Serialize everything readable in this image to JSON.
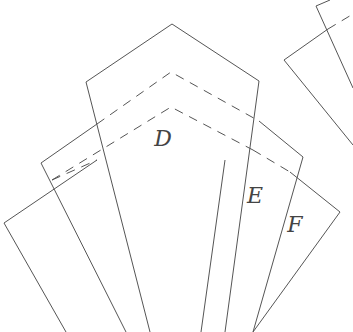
{
  "diagram": {
    "type": "fanned pattern pieces",
    "stroke_color": "#555555",
    "background": "#ffffff",
    "pieces": [
      {
        "id": "A",
        "label": "",
        "points": "4,223 41,196 100,332 66,332",
        "dashed": []
      },
      {
        "id": "B",
        "label": "",
        "points": "41,163 86,131 150,332 126,332",
        "dashed": [
          "41,184 97,124"
        ]
      },
      {
        "id": "C",
        "label": "",
        "points": "86,82 172,24 259,81 225,332 150,332",
        "dashed": [
          "86,131 171,72 259,121",
          "97,160 171,107 253,150"
        ]
      },
      {
        "id": "D_label_piece",
        "label": "D",
        "label_x": 163,
        "label_y": 146
      },
      {
        "id": "E",
        "label": "E",
        "label_x": 254,
        "label_y": 203,
        "points": "259,121 303,157 253,332 201,332",
        "dashed": [
          "253,150 290,172"
        ]
      },
      {
        "id": "F",
        "label": "F",
        "label_x": 295,
        "label_y": 232,
        "points": "303,157 340,212 253,332 225,332",
        "dashed": []
      },
      {
        "id": "G",
        "label": "",
        "points": "284,60 328,29 353,145",
        "dashed": []
      },
      {
        "id": "H",
        "label": "",
        "points": "316,6 330,0",
        "dashed": [
          "328,29 353,14"
        ]
      }
    ],
    "letters": [
      "D",
      "E",
      "F"
    ]
  }
}
